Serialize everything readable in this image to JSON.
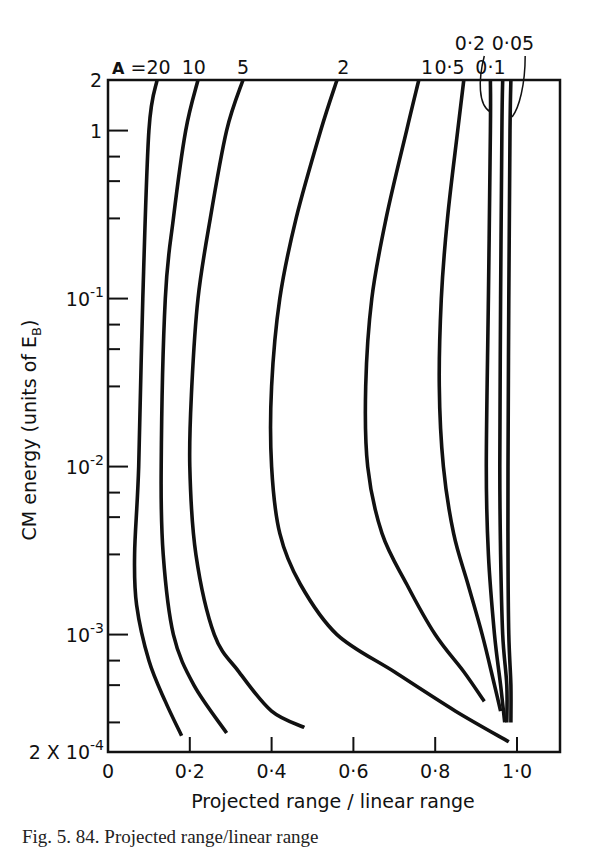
{
  "chart_data": {
    "type": "line",
    "title": "",
    "xlabel": "Projected range / linear range",
    "ylabel": "CM energy (units of E_B)",
    "ylabel_main": "CM energy  (units of E",
    "ylabel_sub": "B",
    "ylabel_close": ")",
    "xlim": [
      0,
      1.1
    ],
    "ylim": [
      0.0002,
      2
    ],
    "yscale": "log",
    "grid": false,
    "legend": "curve labels along top edge",
    "x_ticks": [
      {
        "value": 0,
        "label": "0"
      },
      {
        "value": 0.2,
        "label": "0·2"
      },
      {
        "value": 0.4,
        "label": "0·4"
      },
      {
        "value": 0.6,
        "label": "0·6"
      },
      {
        "value": 0.8,
        "label": "0·8"
      },
      {
        "value": 1.0,
        "label": "1·0"
      }
    ],
    "y_major_ticks": [
      {
        "value": 2,
        "label": "2"
      },
      {
        "value": 1,
        "label": "1"
      },
      {
        "value": 0.1,
        "label": "10",
        "exp": "-1"
      },
      {
        "value": 0.01,
        "label": "10",
        "exp": "-2"
      },
      {
        "value": 0.001,
        "label": "10",
        "exp": "-3"
      },
      {
        "value": 0.0002,
        "label": "2 X 10",
        "exp": "-4"
      }
    ],
    "y_minor_ticks": [
      0.7,
      0.5,
      0.3,
      0.07,
      0.05,
      0.03,
      0.007,
      0.005,
      0.003,
      0.0007,
      0.0005,
      0.0003
    ],
    "series_label_prefix": "A =",
    "series": [
      {
        "name": "20",
        "label": "A =20",
        "points": [
          [
            0.12,
            2
          ],
          [
            0.1,
            1
          ],
          [
            0.085,
            0.1
          ],
          [
            0.075,
            0.01
          ],
          [
            0.065,
            0.003
          ],
          [
            0.07,
            0.0015
          ],
          [
            0.1,
            0.0007
          ],
          [
            0.14,
            0.0004
          ],
          [
            0.18,
            0.00025
          ]
        ]
      },
      {
        "name": "10",
        "label": "10",
        "points": [
          [
            0.22,
            2
          ],
          [
            0.19,
            1
          ],
          [
            0.16,
            0.3
          ],
          [
            0.14,
            0.1
          ],
          [
            0.13,
            0.01
          ],
          [
            0.135,
            0.003
          ],
          [
            0.16,
            0.001
          ],
          [
            0.21,
            0.0005
          ],
          [
            0.29,
            0.00026
          ]
        ]
      },
      {
        "name": "5",
        "label": "5",
        "points": [
          [
            0.33,
            2
          ],
          [
            0.29,
            1
          ],
          [
            0.25,
            0.3
          ],
          [
            0.22,
            0.1
          ],
          [
            0.205,
            0.03
          ],
          [
            0.2,
            0.01
          ],
          [
            0.215,
            0.003
          ],
          [
            0.26,
            0.001
          ],
          [
            0.32,
            0.0006
          ],
          [
            0.4,
            0.00035
          ],
          [
            0.48,
            0.00028
          ]
        ]
      },
      {
        "name": "2",
        "label": "2",
        "points": [
          [
            0.56,
            2
          ],
          [
            0.52,
            1
          ],
          [
            0.46,
            0.3
          ],
          [
            0.42,
            0.1
          ],
          [
            0.4,
            0.03
          ],
          [
            0.4,
            0.01
          ],
          [
            0.42,
            0.004
          ],
          [
            0.47,
            0.002
          ],
          [
            0.56,
            0.001
          ],
          [
            0.7,
            0.0006
          ],
          [
            0.85,
            0.00035
          ],
          [
            0.98,
            0.00023
          ]
        ]
      },
      {
        "name": "1",
        "label": "1",
        "points": [
          [
            0.76,
            2
          ],
          [
            0.73,
            1
          ],
          [
            0.68,
            0.3
          ],
          [
            0.645,
            0.1
          ],
          [
            0.63,
            0.03
          ],
          [
            0.635,
            0.01
          ],
          [
            0.67,
            0.004
          ],
          [
            0.73,
            0.002
          ],
          [
            0.8,
            0.001
          ],
          [
            0.87,
            0.0006
          ],
          [
            0.92,
            0.0004
          ]
        ]
      },
      {
        "name": "0.5",
        "label": "0·5",
        "points": [
          [
            0.87,
            2
          ],
          [
            0.855,
            1
          ],
          [
            0.83,
            0.3
          ],
          [
            0.815,
            0.1
          ],
          [
            0.81,
            0.03
          ],
          [
            0.82,
            0.01
          ],
          [
            0.845,
            0.004
          ],
          [
            0.88,
            0.002
          ],
          [
            0.915,
            0.001
          ],
          [
            0.945,
            0.0005
          ],
          [
            0.96,
            0.00035
          ]
        ]
      },
      {
        "name": "0.2",
        "label": "0·2",
        "points": [
          [
            0.935,
            2
          ],
          [
            0.935,
            1
          ],
          [
            0.93,
            0.1
          ],
          [
            0.925,
            0.01
          ],
          [
            0.93,
            0.003
          ],
          [
            0.945,
            0.001
          ],
          [
            0.96,
            0.0005
          ],
          [
            0.97,
            0.0003
          ]
        ]
      },
      {
        "name": "0.1",
        "label": "0·1",
        "points": [
          [
            0.965,
            2
          ],
          [
            0.963,
            1
          ],
          [
            0.96,
            0.1
          ],
          [
            0.958,
            0.01
          ],
          [
            0.96,
            0.003
          ],
          [
            0.965,
            0.001
          ],
          [
            0.975,
            0.0005
          ],
          [
            0.975,
            0.0003
          ]
        ]
      },
      {
        "name": "0.05",
        "label": "0·05",
        "points": [
          [
            0.985,
            2
          ],
          [
            0.983,
            1
          ],
          [
            0.98,
            0.1
          ],
          [
            0.978,
            0.01
          ],
          [
            0.978,
            0.003
          ],
          [
            0.98,
            0.001
          ],
          [
            0.985,
            0.0005
          ],
          [
            0.985,
            0.0003
          ]
        ]
      }
    ],
    "top_labels": [
      {
        "text": "A =20",
        "x": 0.01,
        "row": "low"
      },
      {
        "text": "10",
        "x": 0.21,
        "row": "low"
      },
      {
        "text": "5",
        "x": 0.33,
        "row": "low"
      },
      {
        "text": "2",
        "x": 0.575,
        "row": "low"
      },
      {
        "text": "1",
        "x": 0.78,
        "row": "low"
      },
      {
        "text": "0·5",
        "x": 0.835,
        "row": "low"
      },
      {
        "text": "0·1",
        "x": 0.935,
        "row": "low"
      },
      {
        "text": "0·2",
        "x": 0.885,
        "row": "high"
      },
      {
        "text": "0·05",
        "x": 0.99,
        "row": "high"
      }
    ]
  },
  "caption": {
    "text": "Fig. 5. 84. Projected range/linear range"
  }
}
